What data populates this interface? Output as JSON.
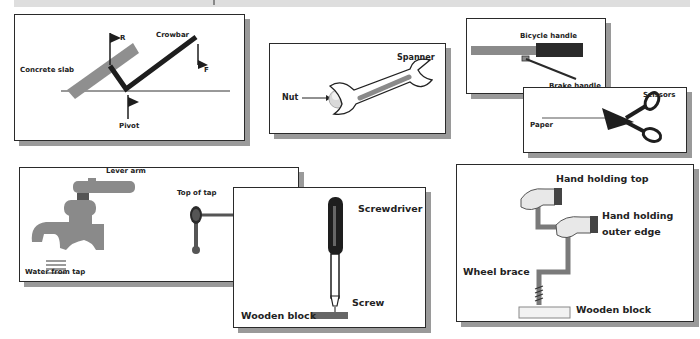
{
  "diagrams": {
    "crowbar": {
      "labels": {
        "concrete_slab": "Concrete slab",
        "crowbar": "Crowbar",
        "resistance": "R",
        "force": "F",
        "pivot": "Pivot"
      }
    },
    "spanner": {
      "labels": {
        "spanner": "Spanner",
        "nut": "Nut"
      }
    },
    "bicycle": {
      "labels": {
        "bicycle_handle": "Bicycle handle",
        "brake_handle": "Brake handle"
      }
    },
    "scissors": {
      "labels": {
        "scissors": "Scissors",
        "paper": "Paper"
      }
    },
    "tap": {
      "labels": {
        "lever_arm_tap": "Lever arm",
        "top_of_tap": "Top of tap",
        "lever_arm_top": "Lever arm",
        "water_from_tap": "Water from tap"
      }
    },
    "screwdriver": {
      "labels": {
        "screwdriver": "Screwdriver",
        "screw": "Screw",
        "wooden_block": "Wooden block"
      }
    },
    "wheel_brace": {
      "labels": {
        "hand_holding_top": "Hand holding top",
        "hand_holding_outer_edge_1": "Hand holding",
        "hand_holding_outer_edge_2": "outer edge",
        "wheel_brace": "Wheel brace",
        "wooden_block": "Wooden block"
      }
    }
  },
  "colors": {
    "card_border": "#2a2a2a",
    "card_shadow": "#9a9a9a",
    "gray_fill": "#8a8a8a",
    "dark_fill": "#2a2a2a",
    "light_gray": "#bdbdbd",
    "top_bar": "#dedede"
  }
}
